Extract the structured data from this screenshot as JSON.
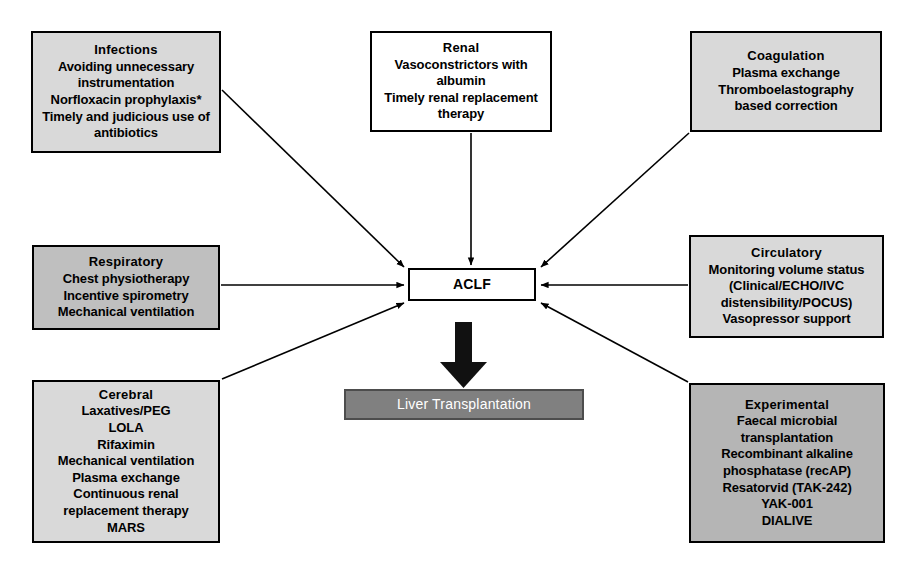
{
  "diagram": {
    "colors": {
      "node_light_gray": "#d9d9d9",
      "node_mid_gray": "#bfbfbf",
      "node_dark_gray": "#b5b5b5",
      "node_white": "#ffffff",
      "transplant_fill": "#808080",
      "transplant_text": "#ffffff",
      "border": "#000000",
      "arrow": "#000000"
    }
  },
  "nodes": {
    "infections": {
      "title": "Infections",
      "lines": [
        "Avoiding unnecessary",
        "instrumentation",
        "Norfloxacin prophylaxis*",
        "Timely and judicious use of",
        "antibiotics"
      ]
    },
    "renal": {
      "title": "Renal",
      "lines": [
        "Vasoconstrictors with",
        "albumin",
        "Timely renal replacement",
        "therapy"
      ]
    },
    "coagulation": {
      "title": "Coagulation",
      "lines": [
        "Plasma exchange",
        "Thromboelastography",
        "based correction"
      ]
    },
    "respiratory": {
      "title": "Respiratory",
      "lines": [
        "Chest physiotherapy",
        "Incentive spirometry",
        "Mechanical ventilation"
      ]
    },
    "circulatory": {
      "title": "Circulatory",
      "lines": [
        "Monitoring volume status",
        "(Clinical/ECHO/IVC",
        "distensibility/POCUS)",
        "Vasopressor support"
      ]
    },
    "cerebral": {
      "title": "Cerebral",
      "lines": [
        "Laxatives/PEG",
        "LOLA",
        "Rifaximin",
        "Mechanical ventilation",
        "Plasma exchange",
        "Continuous renal",
        "replacement therapy",
        "MARS"
      ]
    },
    "experimental": {
      "title": "Experimental",
      "lines": [
        "Faecal microbial",
        "transplantation",
        "Recombinant alkaline",
        "phosphatase (recAP)",
        "Resatorvid (TAK-242)",
        "YAK-001",
        "DIALIVE"
      ]
    },
    "aclf": {
      "title": "ACLF"
    },
    "transplant": {
      "title": "Liver Transplantation"
    }
  },
  "arrows": [
    {
      "name": "infections-to-aclf",
      "from": "infections",
      "to": "aclf",
      "style": "thin-diagonal"
    },
    {
      "name": "renal-to-aclf",
      "from": "renal",
      "to": "aclf",
      "style": "thin-vertical"
    },
    {
      "name": "coagulation-to-aclf",
      "from": "coagulation",
      "to": "aclf",
      "style": "thin-diagonal"
    },
    {
      "name": "respiratory-to-aclf",
      "from": "respiratory",
      "to": "aclf",
      "style": "thin-horizontal"
    },
    {
      "name": "circulatory-to-aclf",
      "from": "circulatory",
      "to": "aclf",
      "style": "thin-horizontal"
    },
    {
      "name": "cerebral-to-aclf",
      "from": "cerebral",
      "to": "aclf",
      "style": "thin-diagonal"
    },
    {
      "name": "experimental-to-aclf",
      "from": "experimental",
      "to": "aclf",
      "style": "thin-diagonal"
    },
    {
      "name": "aclf-to-transplant",
      "from": "aclf",
      "to": "transplant",
      "style": "thick-vertical"
    }
  ]
}
